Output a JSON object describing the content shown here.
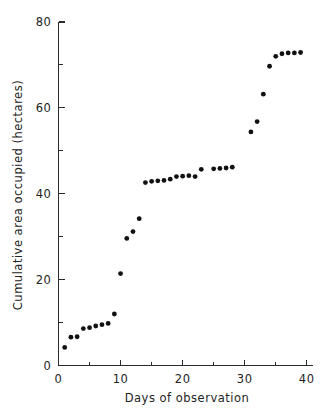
{
  "chart_data": {
    "type": "scatter",
    "title": "",
    "xlabel": "Days of observation",
    "ylabel": "Cumulative area occupied (hectares)",
    "xlim": [
      0,
      41
    ],
    "ylim": [
      0,
      80
    ],
    "grid": false,
    "legend": null,
    "x_major_ticks": [
      0,
      10,
      20,
      30,
      40
    ],
    "x_minor_ticks": [
      5,
      15,
      25,
      35
    ],
    "y_major_ticks": [
      0,
      20,
      40,
      60,
      80
    ],
    "y_minor_ticks": [
      10,
      30,
      50,
      70
    ],
    "x_tick_labels": [
      "0",
      "10",
      "20",
      "30",
      "40"
    ],
    "y_tick_labels": [
      "0",
      "20",
      "40",
      "60",
      "80"
    ],
    "marker": "filled-circle",
    "marker_color": "#111111",
    "x": [
      1,
      2,
      3,
      4,
      5,
      6,
      7,
      8,
      9,
      10,
      11,
      12,
      13,
      14,
      15,
      16,
      17,
      18,
      19,
      20,
      21,
      22,
      23,
      25,
      26,
      27,
      28,
      31,
      32,
      33,
      34,
      35,
      36,
      37,
      38,
      39
    ],
    "values": [
      4.2,
      6.6,
      6.7,
      8.6,
      8.8,
      9.2,
      9.5,
      9.8,
      12.0,
      21.4,
      29.6,
      31.2,
      34.2,
      42.6,
      42.9,
      43.0,
      43.1,
      43.4,
      44.0,
      44.1,
      44.2,
      44.0,
      45.7,
      45.8,
      45.9,
      46.0,
      46.2,
      54.4,
      56.8,
      63.2,
      69.7,
      72.0,
      72.6,
      72.8,
      72.8,
      72.9
    ],
    "n_points": 36
  },
  "axes": {
    "x_label": "Days of observation",
    "y_label": "Cumulative area occupied (hectares)"
  }
}
